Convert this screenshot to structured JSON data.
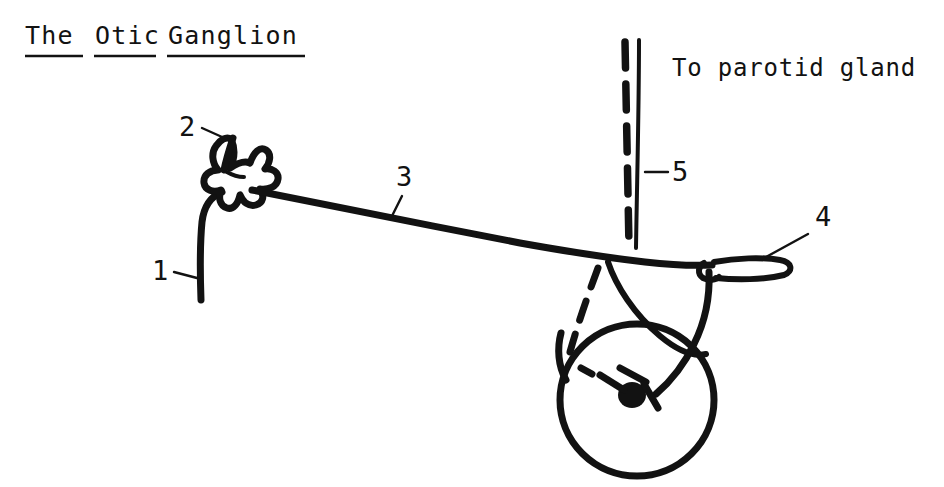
{
  "figure": {
    "title": "The Otic Ganglion",
    "title_words": [
      "The",
      "Otic",
      "Ganglion"
    ],
    "title_underlined": true,
    "caption": "To parotid gland",
    "background_color": "#ffffff",
    "ink_color": "#121212",
    "labels": [
      {
        "id": "1",
        "text": "1"
      },
      {
        "id": "2",
        "text": "2"
      },
      {
        "id": "3",
        "text": "3"
      },
      {
        "id": "4",
        "text": "4"
      },
      {
        "id": "5",
        "text": "5"
      }
    ]
  }
}
